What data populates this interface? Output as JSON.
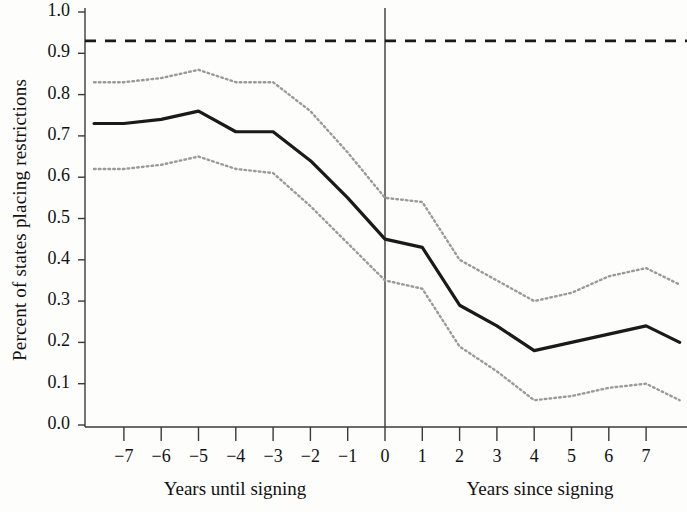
{
  "figure": {
    "background_color": "#fdfdfc",
    "line_color": "#1a1a1a",
    "band_color": "#9a9a9a",
    "axis_color": "#3a3a3a"
  },
  "chart_data": {
    "type": "line",
    "title": "",
    "subtitle": "",
    "xlabel_left": "Years until signing",
    "xlabel_right": "Years since signing",
    "ylabel": "Percent of states placing restrictions",
    "xlim": [
      -7.8,
      7.9
    ],
    "ylim": [
      0.0,
      1.0
    ],
    "grid": false,
    "legend": "none",
    "x_tick_labels": [
      "−7",
      "−6",
      "−5",
      "−4",
      "−3",
      "−2",
      "−1",
      "0",
      "1",
      "2",
      "3",
      "4",
      "5",
      "6",
      "7"
    ],
    "x_tick_values": [
      -7,
      -6,
      -5,
      -4,
      -3,
      -2,
      -1,
      0,
      1,
      2,
      3,
      4,
      5,
      6,
      7
    ],
    "y_tick_labels": [
      "0.0",
      "0.1",
      "0.2",
      "0.3",
      "0.4",
      "0.5",
      "0.6",
      "0.7",
      "0.8",
      "0.9",
      "1.0"
    ],
    "y_tick_values": [
      0.0,
      0.1,
      0.2,
      0.3,
      0.4,
      0.5,
      0.6,
      0.7,
      0.8,
      0.9,
      1.0
    ],
    "reference_line": {
      "name": "baseline-reference",
      "orientation": "horizontal",
      "value": 0.93,
      "style": "dashed"
    },
    "event_line": {
      "name": "signing-event",
      "orientation": "vertical",
      "value": 0,
      "style": "solid"
    },
    "x": [
      -7.8,
      -7,
      -6,
      -5,
      -4,
      -3,
      -2,
      -1,
      0,
      1,
      2,
      3,
      4,
      5,
      6,
      7,
      7.9
    ],
    "series": [
      {
        "name": "Point estimate",
        "style": "solid",
        "values": [
          0.73,
          0.73,
          0.74,
          0.76,
          0.71,
          0.71,
          0.64,
          0.55,
          0.45,
          0.43,
          0.29,
          0.24,
          0.18,
          0.2,
          0.22,
          0.24,
          0.2
        ]
      },
      {
        "name": "Upper confidence bound",
        "style": "dotted",
        "values": [
          0.83,
          0.83,
          0.84,
          0.86,
          0.83,
          0.83,
          0.76,
          0.66,
          0.55,
          0.54,
          0.4,
          0.35,
          0.3,
          0.32,
          0.36,
          0.38,
          0.34
        ]
      },
      {
        "name": "Lower confidence bound",
        "style": "dotted",
        "values": [
          0.62,
          0.62,
          0.63,
          0.65,
          0.62,
          0.61,
          0.53,
          0.44,
          0.35,
          0.33,
          0.19,
          0.13,
          0.06,
          0.07,
          0.09,
          0.1,
          0.06
        ]
      }
    ]
  }
}
